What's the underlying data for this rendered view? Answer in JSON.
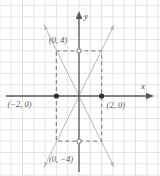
{
  "figure": {
    "kind": "coordinate-plane-graph",
    "background": "#ffffff",
    "grid_color": "#e4e2e6",
    "axis_color": "#58585a",
    "dash_color": "#8e8c92",
    "line_color": "#b9b7bd",
    "label_color": "#5a5a5a",
    "point_color": "#2e2e30",
    "width": 160,
    "height": 176
  },
  "axes": {
    "x_label": "x",
    "y_label": "y",
    "origin": {
      "x": 79,
      "y": 96
    },
    "unit_px": 11.3,
    "x_range": [
      -7,
      7
    ],
    "y_range": [
      -8,
      8
    ]
  },
  "points": [
    {
      "name": "y-intercept-positive",
      "label": "(0, 4)",
      "x": 0,
      "y": 4,
      "filled": false,
      "label_dx": -30,
      "label_dy": -15
    },
    {
      "name": "x-intercept-negative",
      "label": "(−2, 0)",
      "x": -2,
      "y": 0,
      "filled": true,
      "label_dx": -49,
      "label_dy": 4
    },
    {
      "name": "x-intercept-positive",
      "label": "(2, 0)",
      "x": 2,
      "y": 0,
      "filled": true,
      "label_dx": 5,
      "label_dy": 5
    },
    {
      "name": "y-intercept-negative",
      "label": "(0, −4)",
      "x": 0,
      "y": -4,
      "filled": false,
      "label_dx": -30,
      "label_dy": 14
    }
  ],
  "dashed_rectangle": {
    "name": "bounding-rectangle",
    "corners": [
      [
        -2,
        4
      ],
      [
        2,
        4
      ],
      [
        2,
        -4
      ],
      [
        -2,
        -4
      ]
    ]
  },
  "lines": [
    {
      "name": "line-positive-slope",
      "from": [
        -3.1,
        -6.3
      ],
      "to": [
        3.1,
        6.3
      ],
      "arrows": "both"
    },
    {
      "name": "line-negative-slope",
      "from": [
        -3.1,
        6.3
      ],
      "to": [
        3.1,
        -6.3
      ],
      "arrows": "both"
    }
  ],
  "chart_data": {
    "type": "line",
    "title": "",
    "xlabel": "x",
    "ylabel": "y",
    "xlim": [
      -7,
      7
    ],
    "ylim": [
      -8,
      8
    ],
    "grid": true,
    "legend": "none",
    "series": [
      {
        "name": "y = 2x",
        "x": [
          -3.1,
          3.1
        ],
        "values": [
          -6.2,
          6.2
        ],
        "style": "solid-light-arrowed"
      },
      {
        "name": "y = -2x",
        "x": [
          -3.1,
          3.1
        ],
        "values": [
          6.2,
          -6.2
        ],
        "style": "solid-light-arrowed"
      }
    ],
    "annotations": [
      {
        "text": "(0, 4)",
        "x": 0,
        "y": 4
      },
      {
        "text": "(−2, 0)",
        "x": -2,
        "y": 0
      },
      {
        "text": "(2, 0)",
        "x": 2,
        "y": 0
      },
      {
        "text": "(0, −4)",
        "x": 0,
        "y": -4
      }
    ],
    "shapes": [
      {
        "type": "rectangle",
        "style": "dashed",
        "x0": -2,
        "y0": -4,
        "x1": 2,
        "y1": 4
      }
    ]
  }
}
